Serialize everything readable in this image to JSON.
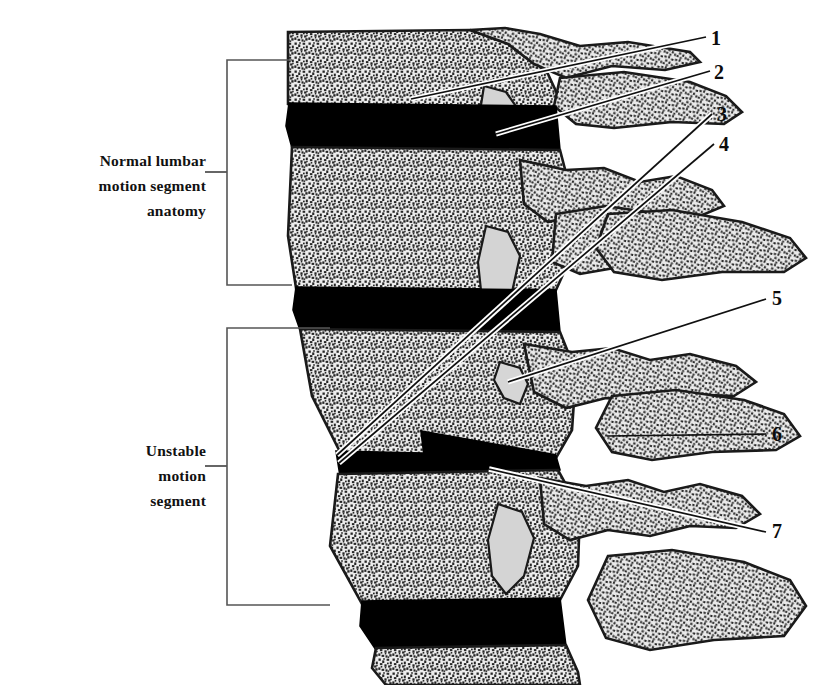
{
  "figure": {
    "kind": "medical-illustration",
    "background_color": "#ffffff",
    "bone_texture_color": "#2b2b2b",
    "bone_fill_color": "#e8e8e8",
    "disc_color": "#000000",
    "facet_joint_color": "#d2d2d2",
    "outline_color": "#1a1a1a",
    "leader_line_color": "#111111",
    "bracket_color": "#4a4a4a"
  },
  "side_labels": {
    "normal": "Normal lumbar\nmotion segment\nanatomy",
    "unstable": "Unstable\nmotion\nsegment"
  },
  "numbers": {
    "n1": "1",
    "n2": "2",
    "n3": "3",
    "n4": "4",
    "n5": "5",
    "n6": "6",
    "n7": "7"
  }
}
